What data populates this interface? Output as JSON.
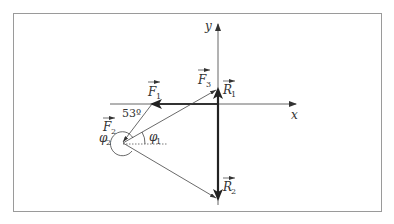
{
  "diagram": {
    "type": "force-vector diagram",
    "axes": {
      "x_label": "x",
      "y_label": "y"
    },
    "vectors": [
      {
        "id": "F1",
        "label": "F",
        "subscript": "1"
      },
      {
        "id": "F2",
        "label": "F",
        "subscript": "2"
      },
      {
        "id": "F3",
        "label": "F",
        "subscript": "3"
      },
      {
        "id": "R1",
        "label": "R",
        "subscript": "1"
      },
      {
        "id": "R2",
        "label": "R",
        "subscript": "2"
      }
    ],
    "angles": [
      {
        "id": "phi1",
        "label": "φ",
        "subscript": "1"
      },
      {
        "id": "phi2",
        "label": "φ",
        "subscript": "2"
      },
      {
        "id": "angle53",
        "label": "53º"
      }
    ]
  }
}
